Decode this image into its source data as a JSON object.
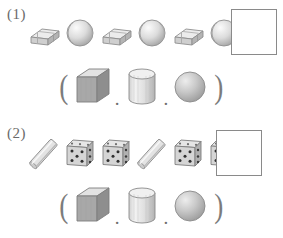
{
  "worksheet": {
    "background_color": "#ffffff",
    "ink_color": "#6a6a6a"
  },
  "problems": [
    {
      "label": "(1)",
      "sequence": {
        "items": [
          {
            "icon": "eraser-icon",
            "name": "eraser"
          },
          {
            "icon": "baseball-icon",
            "name": "ball"
          },
          {
            "icon": "eraser-icon",
            "name": "eraser"
          },
          {
            "icon": "baseball-icon",
            "name": "ball"
          },
          {
            "icon": "eraser-icon",
            "name": "eraser"
          },
          {
            "icon": "baseball-icon",
            "name": "ball"
          }
        ],
        "answer_box": {
          "value": "",
          "label": "empty-answer-box"
        }
      },
      "choices": {
        "open_paren": "(",
        "close_paren": ")",
        "separator": ".",
        "options": [
          {
            "icon": "cube-icon",
            "name": "cube"
          },
          {
            "icon": "cylinder-icon",
            "name": "cylinder"
          },
          {
            "icon": "sphere-icon",
            "name": "sphere"
          }
        ]
      }
    },
    {
      "label": "(2)",
      "sequence": {
        "items": [
          {
            "icon": "stick-icon",
            "name": "stick"
          },
          {
            "icon": "die-icon",
            "name": "die"
          },
          {
            "icon": "die-icon",
            "name": "die"
          },
          {
            "icon": "stick-icon",
            "name": "stick"
          },
          {
            "icon": "die-icon",
            "name": "die"
          },
          {
            "icon": "die-icon",
            "name": "die"
          }
        ],
        "answer_box": {
          "value": "",
          "label": "empty-answer-box"
        }
      },
      "choices": {
        "open_paren": "(",
        "close_paren": ")",
        "separator": ".",
        "options": [
          {
            "icon": "cube-icon",
            "name": "cube"
          },
          {
            "icon": "cylinder-icon",
            "name": "cylinder"
          },
          {
            "icon": "sphere-icon",
            "name": "sphere"
          }
        ]
      }
    }
  ],
  "colors": {
    "outline": "#8a8a8a",
    "light_face": "#e8e8e8",
    "mid_face": "#bdbdbd",
    "dark_face": "#9a9a9a",
    "pip": "#3a3a3a"
  }
}
